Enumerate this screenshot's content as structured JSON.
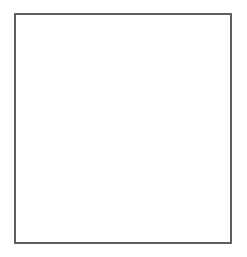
{
  "figure": {
    "background_color": "#ffffff",
    "frame": {
      "name": "square-frame",
      "x": 15,
      "y": 14,
      "width": 216,
      "height": 229,
      "stroke_color": "#595959",
      "stroke_width": 1.6,
      "fill": "#ffffff"
    },
    "shaded_region": {
      "name": "gray-shaded-region",
      "fill_color": "#d4d4d4",
      "stroke_color": "#3a3a3a",
      "stroke_width": 1.8,
      "description": "Region left of the wavy curve, filled light gray",
      "curve_points": [
        {
          "x": 57.5,
          "y": 14
        },
        {
          "x": 53.5,
          "y": 36
        },
        {
          "x": 51.8,
          "y": 58
        },
        {
          "x": 53.5,
          "y": 78
        },
        {
          "x": 60.0,
          "y": 100
        },
        {
          "x": 68.5,
          "y": 117
        },
        {
          "x": 73.0,
          "y": 131
        },
        {
          "x": 73.2,
          "y": 146
        },
        {
          "x": 70.0,
          "y": 159
        },
        {
          "x": 66.2,
          "y": 174
        },
        {
          "x": 64.8,
          "y": 188
        },
        {
          "x": 65.8,
          "y": 202
        },
        {
          "x": 67.5,
          "y": 219
        },
        {
          "x": 68.5,
          "y": 243
        }
      ]
    },
    "dashed_polygon": {
      "name": "dashed-rotated-square",
      "stroke_color": "#7a7a7a",
      "stroke_width": 1.2,
      "dash_pattern": "3 3",
      "fill": "none",
      "vertices": [
        {
          "x": 124,
          "y": 18
        },
        {
          "x": 213,
          "y": 110
        },
        {
          "x": 78,
          "y": 212
        },
        {
          "x": 70.5,
          "y": 233
        },
        {
          "x": 56.5,
          "y": 61
        }
      ],
      "closed": true,
      "note": "Dashed outline of a tilted square whose left portion is hidden behind the shaded region"
    }
  }
}
